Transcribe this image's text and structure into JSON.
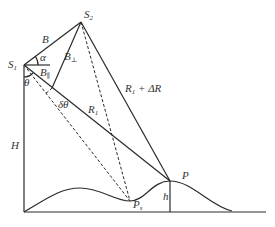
{
  "diagram": {
    "colors": {
      "line": "#2a2a2a",
      "text": "#333333",
      "background": "#ffffff"
    },
    "points": {
      "S1": {
        "x": 24,
        "y": 65,
        "label": "S",
        "sub": "1"
      },
      "S2": {
        "x": 81,
        "y": 22,
        "label": "S",
        "sub": "2"
      },
      "P": {
        "x": 170,
        "y": 181,
        "label": "P"
      },
      "Ps": {
        "x": 130,
        "y": 201,
        "label": "P",
        "sub": "s"
      }
    },
    "labels": {
      "B": "B",
      "alpha": "α",
      "B_perp": "B",
      "B_perp_sub": "⊥",
      "B_par": "B",
      "B_par_sub": "∥",
      "theta": "θ",
      "delta_theta": "δθ",
      "R1": "R",
      "R1_sub": "1",
      "R1_dR": "R",
      "R1_dR_sub": "1",
      "R1_dR_suffix": " + ΔR",
      "H": "H",
      "h": "h"
    }
  }
}
